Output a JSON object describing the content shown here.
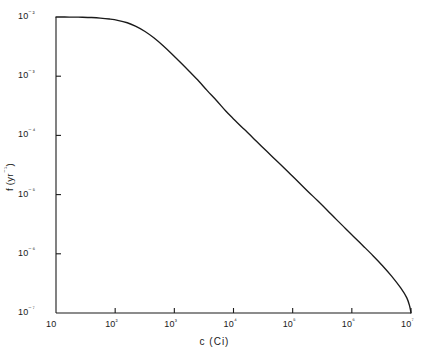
{
  "chart_data": {
    "type": "line",
    "title": "",
    "xlabel": "c (Ci)",
    "ylabel": "f (yr⁻¹)",
    "xscale": "log",
    "yscale": "log",
    "xlim": [
      10,
      10000000
    ],
    "ylim": [
      1e-07,
      0.01
    ],
    "grid": false,
    "legend": null,
    "xticklabels": [
      "10",
      "10²",
      "10³",
      "10⁴",
      "10⁵",
      "10⁶",
      "10⁷"
    ],
    "yticklabels": [
      "10⁻²",
      "10⁻³",
      "10⁻⁴",
      "10⁻⁵",
      "10⁻⁶",
      "10⁻⁷"
    ],
    "xticks": [
      10,
      100,
      1000,
      10000,
      100000,
      1000000,
      10000000
    ],
    "yticks": [
      0.01,
      0.001,
      0.0001,
      1e-05,
      1e-06,
      1e-07
    ],
    "line_color": "#1a1a1a",
    "series": [
      {
        "name": "f(c)",
        "x": [
          10,
          14,
          20,
          28,
          40,
          56,
          80,
          110,
          160,
          220,
          320,
          450,
          640,
          900,
          1300,
          1800,
          2600,
          3600,
          5200,
          7400,
          10000,
          15000,
          21000,
          30000,
          44000,
          63000,
          90000,
          130000,
          185000,
          265000,
          380000,
          540000,
          780000,
          1100000,
          1600000,
          2300000,
          3300000,
          4700000,
          6700000,
          8500000,
          9500000,
          10000000
        ],
        "y": [
          0.01,
          0.00999,
          0.00996,
          0.00991,
          0.0098,
          0.0096,
          0.00925,
          0.0088,
          0.008,
          0.007,
          0.0057,
          0.00445,
          0.0033,
          0.0024,
          0.00167,
          0.0012,
          0.00082,
          0.00057,
          0.000385,
          0.000258,
          0.00019,
          0.000128,
          9.25e-05,
          6.5e-05,
          4.5e-05,
          3.2e-05,
          2.25e-05,
          1.57e-05,
          1.11e-05,
          7.85e-06,
          5.5e-06,
          3.85e-06,
          2.68e-06,
          1.9e-06,
          1.32e-06,
          9.2e-07,
          6.3e-07,
          4.2e-07,
          2.65e-07,
          1.8e-07,
          1.3e-07,
          1e-07
        ]
      }
    ],
    "annotations": {
      "description": "Monotonically decreasing curve on log-log axes: flat plateau at f = 10⁻² for small c, knee near c = 10²–10³, then approximately power-law decay reaching f = 10⁻⁷ at c = 10⁷."
    }
  },
  "axes": {
    "x_axis_name": "c-axis",
    "y_axis_name": "f-axis"
  }
}
